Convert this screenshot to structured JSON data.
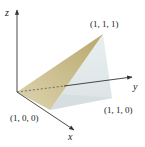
{
  "figure": {
    "type": "3d-tetrahedron",
    "axes": {
      "x": "x",
      "y": "y",
      "z": "z"
    },
    "vertices": {
      "apex": "(1, 1, 1)",
      "base_x": "(1, 0, 0)",
      "base_xy": "(1, 1, 0)"
    },
    "colors": {
      "front_face": "#cfc39a",
      "side_face": "#e6ecee",
      "bottom_face": "#d8e0e2",
      "axis": "#333333"
    }
  }
}
